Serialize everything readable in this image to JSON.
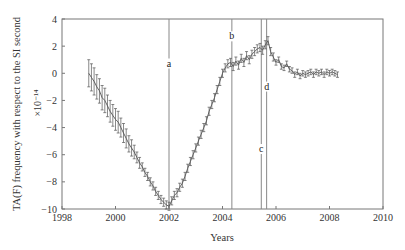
{
  "chart_data": {
    "type": "line",
    "title": "",
    "xlabel": "Years",
    "ylabel": "TA(F) frequency with respect to the SI second",
    "y_multiplier": "×10⁻¹⁴",
    "xlim": [
      1998,
      2010
    ],
    "ylim": [
      -10,
      4
    ],
    "xticks": [
      1998,
      2000,
      2002,
      2004,
      2006,
      2008,
      2010
    ],
    "yticks": [
      -10,
      -8,
      -6,
      -4,
      -2,
      0,
      2,
      4
    ],
    "grid": false,
    "error_bars": true,
    "series": [
      {
        "name": "TA(F) frequency offset",
        "x": [
          1999.0,
          1999.1,
          1999.2,
          1999.3,
          1999.4,
          1999.5,
          1999.6,
          1999.7,
          1999.8,
          1999.9,
          2000.0,
          2000.1,
          2000.2,
          2000.3,
          2000.4,
          2000.5,
          2000.6,
          2000.7,
          2000.8,
          2000.9,
          2001.0,
          2001.1,
          2001.2,
          2001.3,
          2001.4,
          2001.5,
          2001.6,
          2001.7,
          2001.8,
          2001.9,
          2002.0,
          2002.1,
          2002.2,
          2002.3,
          2002.4,
          2002.5,
          2002.6,
          2002.7,
          2002.8,
          2002.9,
          2003.0,
          2003.1,
          2003.2,
          2003.3,
          2003.4,
          2003.5,
          2003.6,
          2003.7,
          2003.8,
          2003.9,
          2004.0,
          2004.1,
          2004.2,
          2004.3,
          2004.4,
          2004.5,
          2004.6,
          2004.7,
          2004.8,
          2004.9,
          2005.0,
          2005.1,
          2005.2,
          2005.3,
          2005.4,
          2005.5,
          2005.6,
          2005.7,
          2005.8,
          2005.9,
          2006.0,
          2006.1,
          2006.2,
          2006.3,
          2006.4,
          2006.5,
          2006.6,
          2006.7,
          2006.8,
          2006.9,
          2007.0,
          2007.1,
          2007.2,
          2007.3,
          2007.4,
          2007.5,
          2007.6,
          2007.7,
          2007.8,
          2007.9,
          2008.0,
          2008.1,
          2008.2,
          2008.3
        ],
        "y": [
          0.0,
          -0.3,
          -0.6,
          -1.0,
          -1.3,
          -1.8,
          -2.0,
          -2.4,
          -2.8,
          -3.1,
          -3.4,
          -3.6,
          -4.0,
          -4.4,
          -4.8,
          -5.2,
          -5.5,
          -5.8,
          -6.2,
          -6.6,
          -6.9,
          -7.3,
          -7.6,
          -8.0,
          -8.3,
          -8.7,
          -9.0,
          -9.3,
          -9.5,
          -9.7,
          -9.8,
          -9.4,
          -9.0,
          -8.8,
          -8.4,
          -8.1,
          -7.6,
          -7.0,
          -6.5,
          -6.0,
          -5.5,
          -5.0,
          -4.5,
          -4.0,
          -3.5,
          -2.8,
          -2.3,
          -1.8,
          -1.2,
          -0.6,
          0.0,
          0.4,
          0.7,
          0.8,
          0.5,
          0.9,
          0.6,
          1.1,
          0.8,
          1.3,
          1.0,
          1.4,
          1.6,
          1.8,
          1.9,
          1.7,
          2.1,
          2.4,
          1.6,
          1.2,
          0.8,
          1.0,
          0.5,
          0.4,
          0.7,
          0.3,
          0.2,
          -0.1,
          0.1,
          -0.2,
          0.0,
          -0.1,
          0.0,
          0.1,
          -0.1,
          0.1,
          0.0,
          0.1,
          -0.1,
          0.1,
          0.0,
          0.1,
          0.0,
          -0.1
        ],
        "err": [
          1.0,
          1.0,
          1.0,
          0.9,
          0.9,
          0.9,
          0.9,
          0.8,
          0.8,
          0.8,
          0.8,
          0.8,
          0.7,
          0.7,
          0.7,
          0.6,
          0.6,
          0.5,
          0.4,
          0.4,
          0.3,
          0.3,
          0.3,
          0.3,
          0.3,
          0.3,
          0.3,
          0.3,
          0.3,
          0.3,
          0.3,
          0.3,
          0.3,
          0.3,
          0.3,
          0.3,
          0.3,
          0.3,
          0.3,
          0.3,
          0.3,
          0.3,
          0.3,
          0.3,
          0.3,
          0.3,
          0.3,
          0.3,
          0.3,
          0.3,
          0.3,
          0.3,
          0.3,
          0.3,
          0.3,
          0.3,
          0.3,
          0.3,
          0.3,
          0.3,
          0.3,
          0.3,
          0.3,
          0.3,
          0.3,
          0.3,
          0.3,
          0.3,
          0.3,
          0.3,
          0.2,
          0.2,
          0.2,
          0.2,
          0.2,
          0.2,
          0.2,
          0.2,
          0.2,
          0.2,
          0.2,
          0.2,
          0.2,
          0.2,
          0.2,
          0.2,
          0.2,
          0.2,
          0.2,
          0.2,
          0.2,
          0.2,
          0.2,
          0.2
        ]
      }
    ],
    "annotations": [
      {
        "label": "a",
        "x": 2002.0,
        "label_y": 0.5
      },
      {
        "label": "b",
        "x": 2004.35,
        "label_y": 2.5
      },
      {
        "label": "c",
        "x": 2005.45,
        "label_y": -5.8
      },
      {
        "label": "d",
        "x": 2005.65,
        "label_y": -1.2
      }
    ]
  },
  "colors": {
    "line": "#555555",
    "axis": "#777777",
    "text": "#333333"
  }
}
